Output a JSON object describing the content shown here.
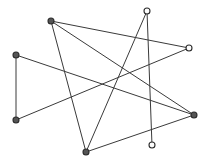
{
  "figure": {
    "background_color": "#ffffff",
    "edge_color": "#3a3a3a",
    "node_stroke_color": "#2b2b2b",
    "node_fill_color": "#fdfdfd",
    "node_filled_color": "#555555",
    "width": 208,
    "height": 162
  },
  "chart_data": {
    "type": "scatter",
    "title": "",
    "xlabel": "",
    "ylabel": "",
    "xlim": [
      0,
      208
    ],
    "ylim": [
      0,
      162
    ],
    "grid": false,
    "legend": "none",
    "node_count": 8,
    "edge_count": 9,
    "nodes": [
      {
        "id": "n1",
        "label": "",
        "x": 51,
        "y": 21,
        "r": 3.0,
        "style": "filled"
      },
      {
        "id": "n2",
        "label": "",
        "x": 147,
        "y": 11,
        "r": 3.0,
        "style": "open"
      },
      {
        "id": "n3",
        "label": "",
        "x": 16,
        "y": 55,
        "r": 3.0,
        "style": "filled"
      },
      {
        "id": "n4",
        "label": "",
        "x": 189,
        "y": 48,
        "r": 3.0,
        "style": "open"
      },
      {
        "id": "n5",
        "label": "",
        "x": 16,
        "y": 120,
        "r": 3.0,
        "style": "filled"
      },
      {
        "id": "n6",
        "label": "",
        "x": 194,
        "y": 115,
        "r": 3.0,
        "style": "filled"
      },
      {
        "id": "n7",
        "label": "",
        "x": 86,
        "y": 152,
        "r": 3.0,
        "style": "filled"
      },
      {
        "id": "n8",
        "label": "",
        "x": 152,
        "y": 145,
        "r": 3.0,
        "style": "open"
      }
    ],
    "edges": [
      {
        "source": "n1",
        "target": "n4"
      },
      {
        "source": "n1",
        "target": "n6"
      },
      {
        "source": "n1",
        "target": "n7"
      },
      {
        "source": "n2",
        "target": "n8"
      },
      {
        "source": "n2",
        "target": "n7"
      },
      {
        "source": "n3",
        "target": "n5"
      },
      {
        "source": "n3",
        "target": "n6"
      },
      {
        "source": "n5",
        "target": "n4"
      },
      {
        "source": "n7",
        "target": "n6"
      }
    ]
  }
}
